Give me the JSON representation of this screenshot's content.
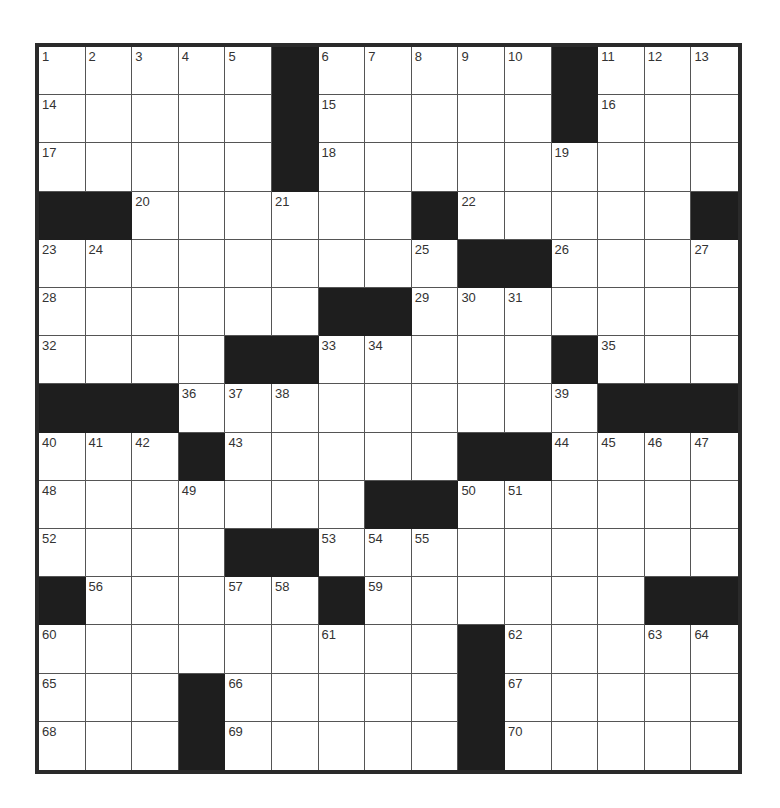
{
  "puzzle": {
    "rows": 15,
    "cols": 15,
    "layout": [
      "1,2,3,4,5,#,6,7,8,9,10,#,11,12,13",
      "14,.,.,.,.,#,15,.,.,.,.,#,16,.,.",
      "17,.,.,.,.,#,18,.,.,.,.,19,.,.,.",
      "#,#,20,.,.,21,.,.,#,22,.,.,.,.,#",
      "23,24,.,.,.,.,.,.,25,#,#,26,.,.,27",
      "28,.,.,.,.,.,#,#,29,30,31,.,.,.,.",
      "32,.,.,.,#,#,33,34,.,.,.,#,35,.,.",
      "#,#,#,36,37,38,.,.,.,.,.,39,#,#,#",
      "40,41,42,#,43,.,.,.,.,#,#,44,45,46,47",
      "48,.,.,49,.,.,.,#,#,50,51,.,.,.,.",
      "52,.,.,.,#,#,53,54,55,.,.,.,.,.,.",
      "#,56,.,.,57,58,#,59,.,.,.,.,.,#,#",
      "60,.,.,.,.,.,61,.,.,#,62,.,.,63,64",
      "65,.,.,#,66,.,.,.,.,#,67,.,.,.,.",
      "68,.,.,#,69,.,.,.,.,#,70,.,.,.,."
    ],
    "clue_numbers": [
      1,
      2,
      3,
      4,
      5,
      6,
      7,
      8,
      9,
      10,
      11,
      12,
      13,
      14,
      15,
      16,
      17,
      18,
      19,
      20,
      21,
      22,
      23,
      24,
      25,
      26,
      27,
      28,
      29,
      30,
      31,
      32,
      33,
      34,
      35,
      36,
      37,
      38,
      39,
      40,
      41,
      42,
      43,
      44,
      45,
      46,
      47,
      48,
      49,
      50,
      51,
      52,
      53,
      54,
      55,
      56,
      57,
      58,
      59,
      60,
      61,
      62,
      63,
      64,
      65,
      66,
      67,
      68,
      69,
      70
    ],
    "colors": {
      "black_square": "#1e1e1e",
      "white_square": "#ffffff",
      "grid_line": "#555555",
      "border": "#2a2a2a",
      "number_text": "#333333"
    }
  }
}
